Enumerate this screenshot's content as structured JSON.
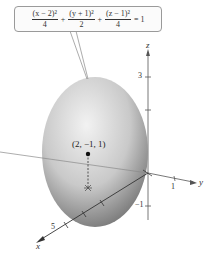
{
  "equation": {
    "terms": [
      {
        "numerator": "(x − 2)²",
        "denominator": "4"
      },
      {
        "numerator": "(y + 1)²",
        "denominator": "2"
      },
      {
        "numerator": "(z − 1)²",
        "denominator": "4"
      }
    ],
    "operators": [
      "+",
      "+"
    ],
    "rhs": "= 1"
  },
  "point": {
    "label": "(2, −1, 1)"
  },
  "axes": {
    "x": {
      "label": "x",
      "tick_label": "5"
    },
    "y": {
      "label": "y",
      "tick_label": "1"
    },
    "z": {
      "label": "z",
      "tick_labels": [
        "3",
        "−1"
      ]
    }
  },
  "colors": {
    "surface_light": "#e6e6e6",
    "surface_dark": "#7a7a7a",
    "axis": "#444444",
    "point": "#111111"
  }
}
